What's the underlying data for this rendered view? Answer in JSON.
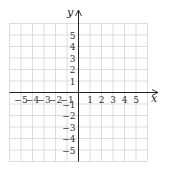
{
  "chart_data": {
    "type": "scatter",
    "title": "",
    "xlabel": "x",
    "ylabel": "y",
    "xlim": [
      -6,
      6
    ],
    "ylim": [
      -6,
      6
    ],
    "grid": true,
    "x_ticks": [
      -5,
      -4,
      -3,
      -2,
      -1,
      1,
      2,
      3,
      4,
      5
    ],
    "y_ticks": [
      5,
      4,
      3,
      2,
      1,
      -1,
      -2,
      -3,
      -4,
      -5
    ],
    "x_tick_labels": [
      "−5",
      "−4",
      "−3",
      "−2",
      "−1",
      "1",
      "2",
      "3",
      "4",
      "5"
    ],
    "y_tick_labels": [
      "5",
      "4",
      "3",
      "2",
      "1",
      "−1",
      "−2",
      "−3",
      "−4",
      "−5"
    ],
    "series": [],
    "legend": null
  },
  "colors": {
    "grid": "#d4d4d4",
    "axis": "#222222",
    "tick_text": "#333333"
  }
}
